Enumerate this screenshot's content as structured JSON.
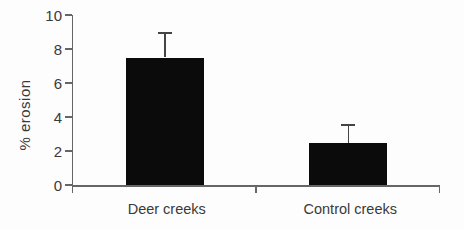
{
  "chart_data": {
    "type": "bar",
    "title": "",
    "xlabel": "",
    "ylabel": "% erosion",
    "categories": [
      "Deer creeks",
      "Control creeks"
    ],
    "values": [
      7.5,
      2.5
    ],
    "errors_plus": [
      1.4,
      1.0
    ],
    "ylim": [
      0,
      10
    ],
    "yticks": [
      0,
      2,
      4,
      6,
      8,
      10
    ],
    "grid": false,
    "legend": false,
    "bar_color": "#0b0b0b",
    "axis_color": "#666666",
    "text_color": "#3a3a3a",
    "background_color": "#fdfdfd"
  }
}
